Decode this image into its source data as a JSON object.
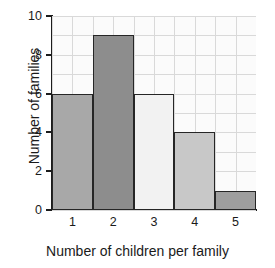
{
  "chart_data": {
    "type": "bar",
    "title": "",
    "xlabel": "Number of children per family",
    "ylabel": "Number of families",
    "categories": [
      "1",
      "2",
      "3",
      "4",
      "5"
    ],
    "values": [
      6,
      9,
      6,
      4,
      1
    ],
    "ylim": [
      0,
      10
    ],
    "yticks": [
      "0",
      "2",
      "4",
      "6",
      "8",
      "10"
    ],
    "ytick_values": [
      0,
      2,
      4,
      6,
      8,
      10
    ],
    "grid": true,
    "legend": "none",
    "bar_colors": [
      "#a8a8a8",
      "#8d8d8d",
      "#f2f2f2",
      "#c8c8c8",
      "#9e9e9e"
    ],
    "bar_edge_color": "#262626",
    "grid_color": "#d9d9d9",
    "axis_color": "#1c1c1c",
    "plot_background": "#fbfbfb"
  }
}
